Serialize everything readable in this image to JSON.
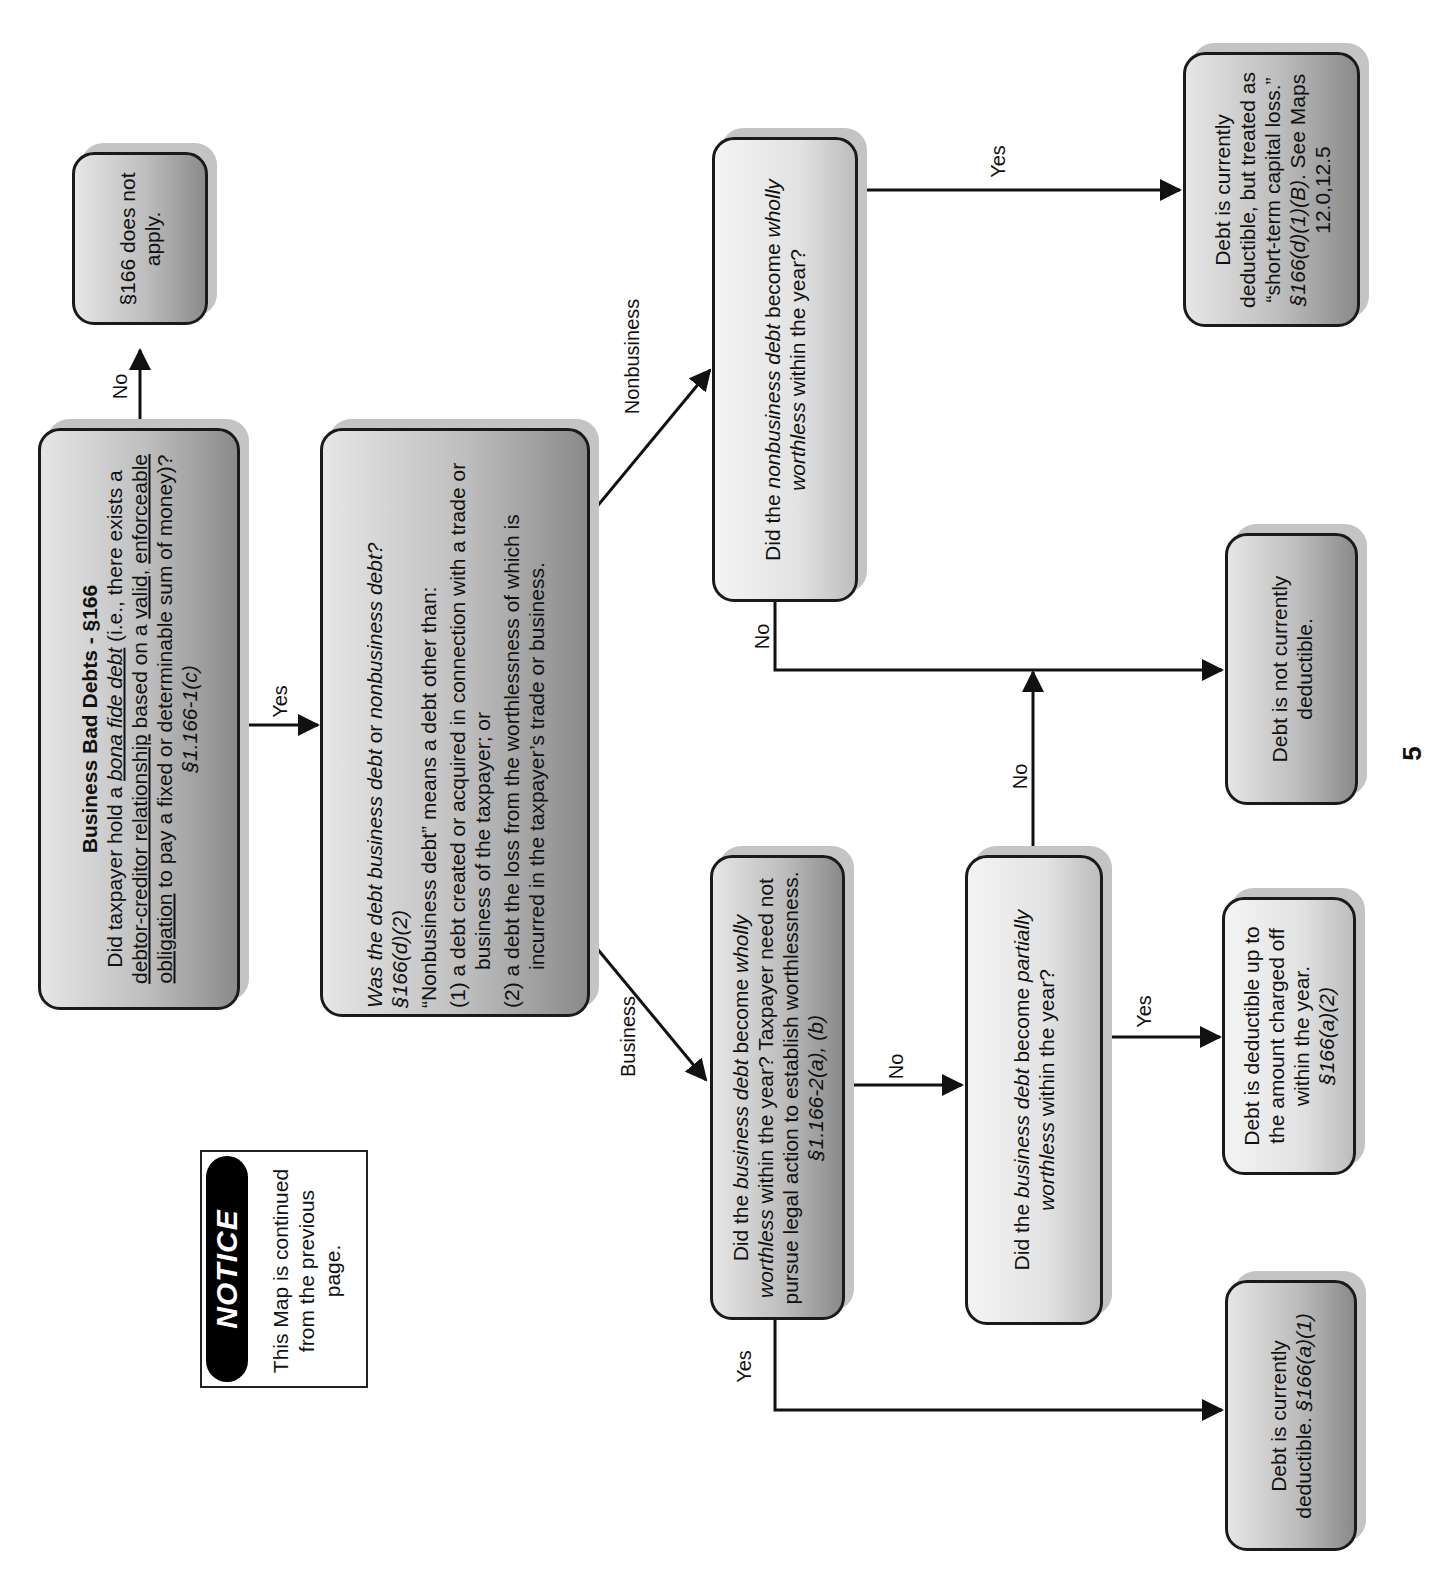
{
  "page": {
    "orientation": "rotated-90-ccw",
    "page_number": "5"
  },
  "notice": {
    "heading": "NOTICE",
    "text": "This Map is continued from the previous page."
  },
  "nodes": {
    "start": {
      "title": "Business Bad Debts - §166",
      "q1": "Did taxpayer hold a ",
      "q1_ital": "bona fide debt",
      "q2": " (i.e., there exists a ",
      "u1": "debtor-creditor relationship",
      "q3": " based on a ",
      "u2": "valid,",
      "u3": "enforceable obligation",
      "q4": " to pay a fixed or determinable sum of money)?  ",
      "cite": "§1.166-1(c)"
    },
    "not_apply": {
      "text": "§166 does not apply."
    },
    "classify": {
      "q_a": "Was the debt ",
      "q_ital1": "business debt",
      "q_b": " or ",
      "q_ital2": "nonbusiness debt?",
      "cite": "§166(d)(2)",
      "definition": "“Nonbusiness debt” means a debt other than:",
      "items": [
        "(1)  a debt created or acquired in connection with a trade or business of the taxpayer; or",
        "(2)  a debt the loss from the worthlessness of which is incurred in the taxpayer’s trade or business."
      ]
    },
    "nonbusiness_wholly": {
      "a": "Did the ",
      "ital1": "nonbusiness debt",
      "b": " become ",
      "ital2": "wholly worthless",
      "c": " within the year?"
    },
    "business_wholly": {
      "a": "Did the ",
      "ital1": "business debt",
      "b": " become ",
      "ital2": "wholly worthless",
      "c": " within the year?  Taxpayer need not pursue legal action to establish worthlessness.  ",
      "cite": "§1.166-2(a), (b)"
    },
    "business_partially": {
      "a": "Did the ",
      "ital1": "business debt",
      "b": " become ",
      "ital2": "partially worthless",
      "c": " within the year?"
    },
    "short_term": {
      "a": "Debt is currently deductible, but treated as “short-term capital loss.”  ",
      "cite": "§166(d)(1)(B)",
      "b": ".  See Maps 12.0,12.5"
    },
    "not_deductible": {
      "text": "Debt is not currently deductible."
    },
    "partial_deduct": {
      "text": "Debt is deductible up to the amount charged off within the year.",
      "cite": "§166(a)(2)"
    },
    "currently_deductible": {
      "text": "Debt is currently deductible.  ",
      "cite": "§166(a)(1)"
    }
  },
  "edges": {
    "start_no": "No",
    "start_yes": "Yes",
    "business": "Business",
    "nonbusiness": "Nonbusiness",
    "nb_yes": "Yes",
    "nb_no": "No",
    "bw_yes": "Yes",
    "bw_no": "No",
    "bp_yes": "Yes",
    "bp_no": "No"
  }
}
